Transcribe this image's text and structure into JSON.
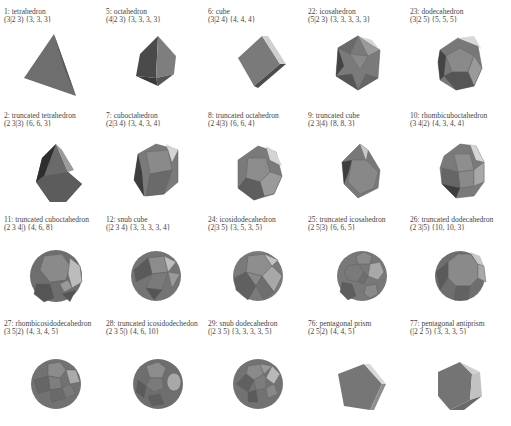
{
  "figure": {
    "rows": [
      [
        {
          "name": "1: tetrahedron",
          "symbol": "(3|2 3)  {3, 3, 3}",
          "shape": "tetrahedron"
        },
        {
          "name": "5: octahedron",
          "symbol": "(4|2 3)  {3, 3, 3, 3}",
          "shape": "octahedron"
        },
        {
          "name": "6: cube",
          "symbol": "(3|2 4)  {4, 4, 4}",
          "shape": "cube"
        },
        {
          "name": "22: icosahedron",
          "symbol": "(5|2 3)  {3, 3, 3, 3, 3}",
          "shape": "icosahedron"
        },
        {
          "name": "23: dodecahedron",
          "symbol": "(3|2 5)  {5, 5, 5}",
          "shape": "dodecahedron"
        }
      ],
      [
        {
          "name": "2: truncated tetrahedron",
          "symbol": "(2 3|3)  {6, 6, 3}",
          "shape": "truncated-tetrahedron"
        },
        {
          "name": "7: cuboctahedron",
          "symbol": "(2|3 4)  {3, 4, 3, 4}",
          "shape": "cuboctahedron"
        },
        {
          "name": "8: truncated octahedron",
          "symbol": "(2 4|3)  {6, 6, 4}",
          "shape": "truncated-octahedron"
        },
        {
          "name": "9: truncated cube",
          "symbol": "(2 3|4)  {8, 8, 3}",
          "shape": "truncated-cube"
        },
        {
          "name": "10: rhombicuboctahedron",
          "symbol": "(3 4|2)  {4, 3, 4, 4}",
          "shape": "rhombicuboctahedron"
        }
      ],
      [
        {
          "name": "11: truncated cuboctahedron",
          "symbol": "(2 3 4|)  {4, 6, 8}",
          "shape": "truncated-cuboctahedron"
        },
        {
          "name": "12: snub cube",
          "symbol": "(|2 3 4)  {3, 3, 3, 3, 4}",
          "shape": "snub-cube"
        },
        {
          "name": "24: icosidodecahedron",
          "symbol": "(2|3 5)  {3, 5, 3, 5}",
          "shape": "icosidodecahedron"
        },
        {
          "name": "25: truncated icosahedron",
          "symbol": "(2 5|3)  {6, 6, 5}",
          "shape": "truncated-icosahedron"
        },
        {
          "name": "26: truncated dodecahedron",
          "symbol": "(2 3|5)  {10, 10, 3}",
          "shape": "truncated-dodecahedron"
        }
      ],
      [
        {
          "name": "27: rhombicosidodecahedron",
          "symbol": "(3 5|2)  {4, 3, 4, 5}",
          "shape": "rhombicosidodecahedron"
        },
        {
          "name": "28: truncated icosidodechedon",
          "symbol": "(2 3 5|)  {4, 6, 10}",
          "shape": "truncated-icosidodecahedron"
        },
        {
          "name": "29: snub dodecahedron",
          "symbol": "(|2 3 5)  {3, 3, 3, 3, 5}",
          "shape": "snub-dodecahedron"
        },
        {
          "name": "76: pentagonal prism",
          "symbol": "(2 5|2)  {4, 4, 5}",
          "shape": "pentagonal-prism"
        },
        {
          "name": "77: pentagonal antiprism",
          "symbol": "(|2 2 5)  {3, 3, 3, 5}",
          "shape": "pentagonal-antiprism"
        }
      ]
    ],
    "colors": {
      "face_dark": "#4a4a4a",
      "face_mid": "#7a7a7a",
      "face_light": "#a8a8a8",
      "face_highlight": "#d8d8d8",
      "edge": "#5e5e5e",
      "label_text": "#444444"
    }
  }
}
